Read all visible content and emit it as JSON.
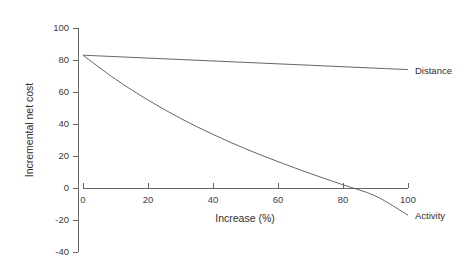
{
  "chart_data": {
    "type": "line",
    "title": "",
    "xlabel": "Increase (%)",
    "ylabel": "Incremental net cost",
    "xlim": [
      0,
      100
    ],
    "ylim": [
      -40,
      100
    ],
    "xticks": [
      0,
      20,
      40,
      60,
      80,
      100
    ],
    "xticklabels": [
      "0",
      "20",
      "40",
      "60",
      "80",
      "100"
    ],
    "yticks": [
      -40,
      -20,
      0,
      20,
      40,
      60,
      80,
      100
    ],
    "yticklabels": [
      "-40",
      "-20",
      "0",
      "20",
      "40",
      "60",
      "80",
      "100"
    ],
    "grid": false,
    "legend_position": "inline-right-end-labels",
    "x": [
      0,
      10,
      20,
      30,
      40,
      50,
      60,
      70,
      80,
      90,
      100
    ],
    "series": [
      {
        "name": "Distance",
        "label": "Distance",
        "values": [
          83,
          82.1,
          81.2,
          80.3,
          79.4,
          78.5,
          77.6,
          76.7,
          75.8,
          74.9,
          74
        ]
      },
      {
        "name": "Activity",
        "label": "Activity",
        "values": [
          83,
          68,
          55,
          43.5,
          33.5,
          24.5,
          16.5,
          9,
          2,
          -5,
          -17
        ]
      }
    ],
    "annotations": [
      {
        "text": "Distance",
        "x": 100,
        "y": 74
      },
      {
        "text": "Activity",
        "x": 100,
        "y": -17
      }
    ]
  },
  "axes": {
    "y_tick_labels": [
      "100",
      "80",
      "60",
      "40",
      "20",
      "0",
      "-20",
      "-40"
    ],
    "x_tick_labels": [
      "0",
      "20",
      "40",
      "60",
      "80",
      "100"
    ],
    "y_title": "Incremental net cost",
    "x_title": "Increase (%)"
  },
  "series_labels": {
    "distance": "Distance",
    "activity": "Activity"
  },
  "colors": {
    "background": "#ffffff",
    "line": "#555555",
    "text": "#303030",
    "axis": "#555555"
  }
}
